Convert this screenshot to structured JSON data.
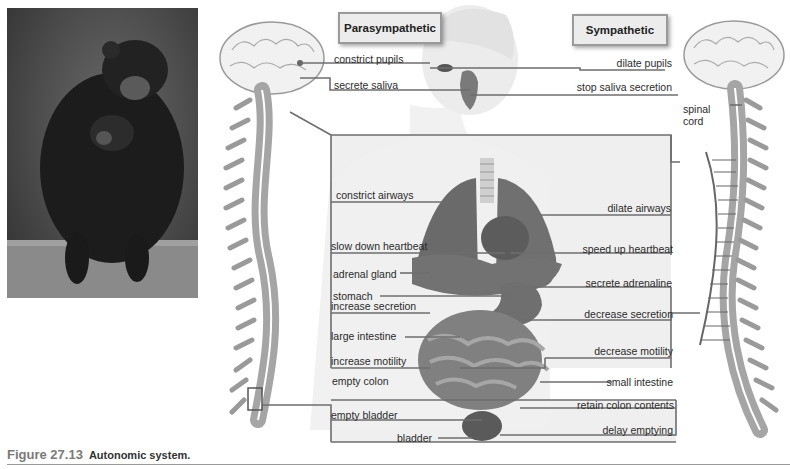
{
  "figure": {
    "number": "Figure 27.13",
    "caption": "Autonomic system."
  },
  "headers": {
    "parasympathetic": "Parasympathetic",
    "sympathetic": "Sympathetic"
  },
  "parasympathetic_labels": [
    "constrict pupils",
    "secrete saliva",
    "constrict airways",
    "slow down heartbeat",
    "increase secretion",
    "increase motility",
    "empty colon",
    "empty bladder"
  ],
  "sympathetic_labels": [
    "dilate pupils",
    "stop saliva secretion",
    "dilate airways",
    "speed up heartbeat",
    "secrete adrenaline",
    "decrease secretion",
    "decrease motility",
    "retain colon contents",
    "delay emptying"
  ],
  "organ_labels": {
    "adrenal_gland": "adrenal gland",
    "stomach": "stomach",
    "large_intestine": "large intestine",
    "small_intestine": "small intestine",
    "bladder": "bladder",
    "spinal_cord": "spinal cord"
  },
  "colors": {
    "line": "#6e6e6e",
    "panel": "#ececec",
    "organ": "#6f6f6f",
    "bone": "#9e9e9e"
  }
}
